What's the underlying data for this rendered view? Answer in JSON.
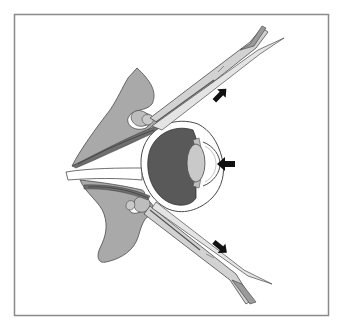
{
  "figure": {
    "type": "anatomical-diagram",
    "frame": {
      "x": 14,
      "y": 14,
      "width": 315,
      "height": 302,
      "stroke": "#8a8a8a"
    },
    "colors": {
      "background": "#ffffff",
      "tissue": "#a9a9a9",
      "tissue_light": "#c4c4c4",
      "vitreous": "#595959",
      "lens": "#c9c9c9",
      "muscle": "#6e6e6e",
      "instrument": "#d2d2d2",
      "outline": "#4a4a4a",
      "arrow": "#111111"
    },
    "arrows": [
      {
        "id": "upper-instrument-arrow",
        "direction": "up-right",
        "x": 220,
        "y": 95
      },
      {
        "id": "cornea-arrow",
        "direction": "left",
        "x": 225,
        "y": 164
      },
      {
        "id": "lower-instrument-arrow",
        "direction": "down-right",
        "x": 220,
        "y": 247
      }
    ],
    "parts": [
      "upper-eyelid",
      "lower-eyelid",
      "eyeball",
      "lens",
      "cornea",
      "extraocular-muscles",
      "optic-region",
      "upper-retractor",
      "lower-retractor"
    ]
  }
}
